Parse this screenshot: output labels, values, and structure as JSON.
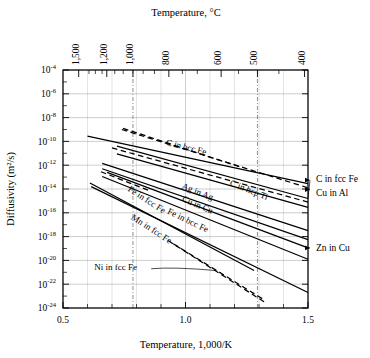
{
  "chart_data": {
    "type": "line",
    "title": "Temperature, °C",
    "xlabel": "Temperature, 1,000/K",
    "ylabel": "Diffusivity (m²/s)",
    "xlim": [
      0.5,
      1.5
    ],
    "ylim_exponent": [
      -24,
      -4
    ],
    "grid": true,
    "legend_position": "inline-labels",
    "x_ticks": [
      {
        "value": 0.5,
        "label": "0.5"
      },
      {
        "value": 1.0,
        "label": "1.0"
      },
      {
        "value": 1.5,
        "label": "1.5"
      }
    ],
    "x_minor_ticks": [
      0.6,
      0.7,
      0.8,
      0.9,
      1.1,
      1.2,
      1.3,
      1.4
    ],
    "y_ticks": [
      {
        "exponent": -4,
        "mantissa": "10",
        "label": "-4"
      },
      {
        "exponent": -6,
        "mantissa": "10",
        "label": "-6"
      },
      {
        "exponent": -8,
        "mantissa": "10",
        "label": "-8"
      },
      {
        "exponent": -10,
        "mantissa": "10",
        "label": "-10"
      },
      {
        "exponent": -12,
        "mantissa": "10",
        "label": "-12"
      },
      {
        "exponent": -14,
        "mantissa": "10",
        "label": "-14"
      },
      {
        "exponent": -16,
        "mantissa": "10",
        "label": "-16"
      },
      {
        "exponent": -18,
        "mantissa": "10",
        "label": "-18"
      },
      {
        "exponent": -20,
        "mantissa": "10",
        "label": "-20"
      },
      {
        "exponent": -22,
        "mantissa": "10",
        "label": "-22"
      },
      {
        "exponent": -24,
        "mantissa": "10",
        "label": "-24"
      }
    ],
    "y_minor_ticks": [
      -5,
      -7,
      -9,
      -11,
      -13,
      -15,
      -17,
      -19,
      -21,
      -23
    ],
    "top_axis": {
      "title": "Temperature, °C",
      "ticks": [
        {
          "celsius": 1500,
          "label": "1,500",
          "x": 0.564
        },
        {
          "celsius": 1200,
          "label": "1,200",
          "x": 0.6787
        },
        {
          "celsius": 1000,
          "label": "1,000",
          "x": 0.7855
        },
        {
          "celsius": 800,
          "label": "800",
          "x": 0.932
        },
        {
          "celsius": 600,
          "label": "600",
          "x": 1.1455
        },
        {
          "celsius": 500,
          "label": "500",
          "x": 1.2937
        },
        {
          "celsius": 400,
          "label": "400",
          "x": 1.4859
        }
      ],
      "minor_ticks_x": [
        0.606,
        0.6321,
        0.6596,
        0.7112,
        0.7457,
        0.8271,
        0.8734,
        0.9872,
        1.0482,
        1.2165,
        1.3812
      ],
      "highlight_lines_x": [
        0.7855,
        1.2937
      ]
    },
    "series": [
      {
        "name": "C in bcc Fe",
        "style": "solid",
        "x0": 0.6,
        "y0": -9.55,
        "x1": 1.5,
        "y1": -13.55,
        "label_pos": {
          "x": 1.0,
          "dy": -5
        },
        "label_anchor": "inline"
      },
      {
        "name": "C in fcc Fe",
        "style": "solid",
        "x0": 0.72,
        "y0": -10.4,
        "x1": 1.5,
        "y1": -14.8,
        "label_pos": null,
        "label_anchor": "right",
        "right_y": -13.25
      },
      {
        "name": "Cu in Al",
        "style": "dashed",
        "x0": 0.74,
        "y0": -9.0,
        "x1": 1.5,
        "y1": -13.9,
        "label_pos": null,
        "label_anchor": "right",
        "right_y": -14.05
      },
      {
        "name": "C in hcp Ti",
        "style": "solid",
        "x0": 0.72,
        "y0": -11.05,
        "x1": 1.5,
        "y1": -15.55,
        "label_pos": {
          "x": 1.27,
          "dy": -4
        },
        "label_anchor": "inline"
      },
      {
        "name": "Ag in Ag",
        "style": "solid",
        "x0": 0.66,
        "y0": -11.85,
        "x1": 1.5,
        "y1": -17.5,
        "label_pos": {
          "x": 1.06,
          "dy": -4
        },
        "label_anchor": "inline"
      },
      {
        "name": "Cu in Cu",
        "style": "solid",
        "x0": 0.66,
        "y0": -12.3,
        "x1": 1.5,
        "y1": -18.25,
        "label_pos": {
          "x": 1.05,
          "dy": -4
        },
        "label_anchor": "inline"
      },
      {
        "name": "Zn in Cu",
        "style": "solid",
        "x0": 0.68,
        "y0": -12.6,
        "x1": 1.5,
        "y1": -18.95,
        "label_pos": null,
        "label_anchor": "right",
        "right_y": -18.95
      },
      {
        "name": "Fe in bcc Fe",
        "style": "solid",
        "x0": 0.66,
        "y0": -12.95,
        "x1": 1.5,
        "y1": -19.9,
        "label_pos": {
          "x": 0.99,
          "dy": -4
        },
        "label_anchor": "inline"
      },
      {
        "name": "Fe in fcc Fe",
        "style": "solid",
        "x0": 0.61,
        "y0": -13.5,
        "x1": 1.28,
        "y1": -20.85,
        "label_pos": {
          "x": 0.83,
          "dy": -4
        },
        "label_anchor": "inline"
      },
      {
        "name": "Mn in fcc Fe",
        "style": "solid",
        "x0": 0.615,
        "y0": -13.8,
        "x1": 1.5,
        "y1": -22.7,
        "label_pos": {
          "x": 0.83,
          "dy": 8
        },
        "label_anchor": "inline"
      },
      {
        "name": "Ni in fcc Fe",
        "style": "dashed",
        "x0": 0.95,
        "y0": -18.6,
        "x1": 1.32,
        "y1": -23.3,
        "label_pos": null,
        "label_anchor": "leader",
        "leader": {
          "tx": 0.86,
          "ty": -20.7
        }
      },
      {
        "name": "dashed-upper-1",
        "style": "dashed",
        "x0": 0.745,
        "y0": -8.9,
        "x1": 1.23,
        "y1": -12.2,
        "label_pos": null,
        "label_anchor": "none"
      },
      {
        "name": "dashed-upper-2",
        "style": "dashed",
        "x0": 0.7,
        "y0": -10.55,
        "x1": 1.5,
        "y1": -15.1,
        "label_pos": null,
        "label_anchor": "none"
      },
      {
        "name": "dashed-mid-1",
        "style": "dashed",
        "x0": 0.655,
        "y0": -12.55,
        "x1": 0.86,
        "y1": -14.2,
        "label_pos": null,
        "label_anchor": "none"
      },
      {
        "name": "dashed-low-1",
        "style": "dashed",
        "x0": 0.93,
        "y0": -18.35,
        "x1": 1.33,
        "y1": -23.6,
        "label_pos": null,
        "label_anchor": "none"
      }
    ],
    "inline_labels": [
      {
        "text": "C in bcc Fe",
        "x": 1.0,
        "y": -10.72,
        "rotate": 14
      },
      {
        "text": "C in hcp Ti",
        "x": 1.255,
        "y": -14.3,
        "rotate": 22
      },
      {
        "text": "Ag in Ag",
        "x": 1.045,
        "y": -14.45,
        "rotate": 22
      },
      {
        "text": "Cu in Cu",
        "x": 1.045,
        "y": -15.55,
        "rotate": 23
      },
      {
        "text": "Fe in bcc Fe",
        "x": 1.005,
        "y": -16.85,
        "rotate": 26
      },
      {
        "text": "Fe in fcc Fe",
        "x": 0.835,
        "y": -15.1,
        "rotate": 33
      },
      {
        "text": "Mn in fcc Fe",
        "x": 0.855,
        "y": -17.55,
        "rotate": 33
      },
      {
        "text": "Ni in fcc Fe",
        "x": 0.715,
        "y": -20.8,
        "rotate": 0
      }
    ],
    "right_labels": [
      {
        "text": "C in fcc Fe",
        "y": -13.1
      },
      {
        "text": "Cu in Al",
        "y": -14.3
      },
      {
        "text": "Zn in Cu",
        "y": -18.95
      }
    ]
  }
}
